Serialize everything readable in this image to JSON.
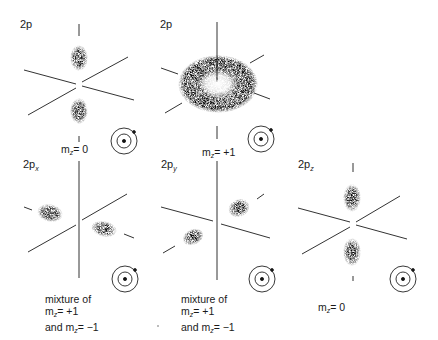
{
  "figure": {
    "panels": [
      {
        "id": "2p-m0",
        "title": "2p",
        "subscript": "",
        "caption_lines": [
          "m_z = 0"
        ],
        "mz_main": "m",
        "mz_sub": "z",
        "mz_rest": "= 0",
        "shape": "two lobes along vertical axis"
      },
      {
        "id": "2p-m+1",
        "title": "2p",
        "subscript": "",
        "caption_lines": [
          "m_z = +1"
        ],
        "mz_main": "m",
        "mz_sub": "z",
        "mz_rest": "= +1",
        "shape": "torus around vertical axis"
      },
      {
        "id": "2px",
        "title": "2p",
        "subscript": "x",
        "caption_lines": [
          "mixture of",
          "m_z = +1",
          "and m_z = −1"
        ],
        "shape": "two lobes along x axis"
      },
      {
        "id": "2py",
        "title": "2p",
        "subscript": "y",
        "caption_lines": [
          "mixture of",
          "m_z = +1",
          "and m_z = −1"
        ],
        "shape": "two lobes along y axis"
      },
      {
        "id": "2pz",
        "title": "2p",
        "subscript": "z",
        "caption_lines": [
          "m_z = 0"
        ],
        "mz_main": "m",
        "mz_sub": "z",
        "mz_rest": "= 0",
        "shape": "two lobes along z axis"
      }
    ],
    "text": {
      "t1": "2p",
      "t2": "2p",
      "t3": "2p",
      "t3s": "x",
      "t4": "2p",
      "t4s": "y",
      "t5": "2p",
      "t5s": "z",
      "m": "m",
      "z": "z",
      "eq0": "= 0",
      "eqp1": "= +1",
      "mixture": "mixture of",
      "line2": "= +1",
      "and": "and  m",
      "line3": "= −1"
    },
    "icon": "atom-orbit-icon",
    "colors": {
      "ink": "#111111",
      "background": "#ffffff",
      "axis": "#333333"
    }
  }
}
